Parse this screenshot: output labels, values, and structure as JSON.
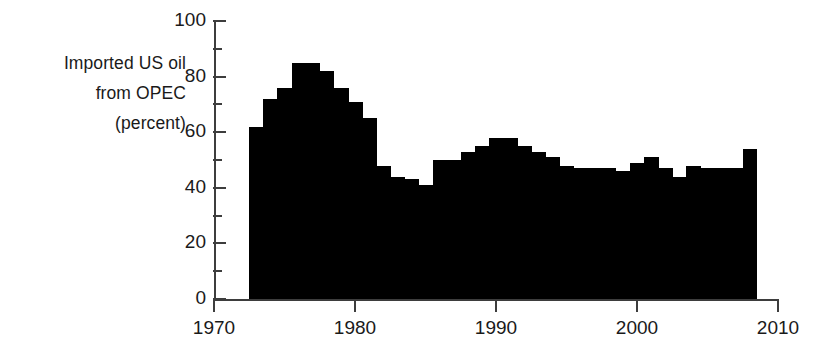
{
  "chart_data": {
    "type": "bar",
    "title": "",
    "subtitle": "",
    "ylabel_lines": [
      "Imported US oil",
      "from OPEC",
      "(percent)"
    ],
    "ylabel": "Imported US oil from OPEC (percent)",
    "xlabel": "",
    "xlim": [
      1970,
      2010
    ],
    "ylim": [
      0,
      100
    ],
    "grid": false,
    "legend": null,
    "annotations": [],
    "x_ticks": [
      1970,
      1980,
      1990,
      2000,
      2010
    ],
    "x_tick_labels": [
      "1970",
      "1980",
      "1990",
      "2000",
      "2010"
    ],
    "y_ticks": [
      0,
      20,
      40,
      60,
      80,
      100
    ],
    "y_tick_labels": [
      "0",
      "20",
      "40",
      "60",
      "80",
      "100"
    ],
    "y_minor_ticks": [
      10,
      30,
      50,
      70,
      90
    ],
    "bar_color": "#000000",
    "axis_color": "#3d3d3d",
    "text_color": "#1a1a1a",
    "categories": [
      1973,
      1974,
      1975,
      1976,
      1977,
      1978,
      1979,
      1980,
      1981,
      1982,
      1983,
      1984,
      1985,
      1986,
      1987,
      1988,
      1989,
      1990,
      1991,
      1992,
      1993,
      1994,
      1995,
      1996,
      1997,
      1998,
      1999,
      2000,
      2001,
      2002,
      2003,
      2004,
      2005,
      2006,
      2007,
      2008
    ],
    "values": [
      62,
      72,
      76,
      85,
      85,
      82,
      76,
      71,
      65,
      48,
      44,
      43,
      41,
      50,
      50,
      53,
      55,
      58,
      58,
      55,
      53,
      51,
      48,
      47,
      47,
      47,
      46,
      49,
      51,
      47,
      44,
      48,
      47,
      47,
      47,
      54
    ]
  }
}
